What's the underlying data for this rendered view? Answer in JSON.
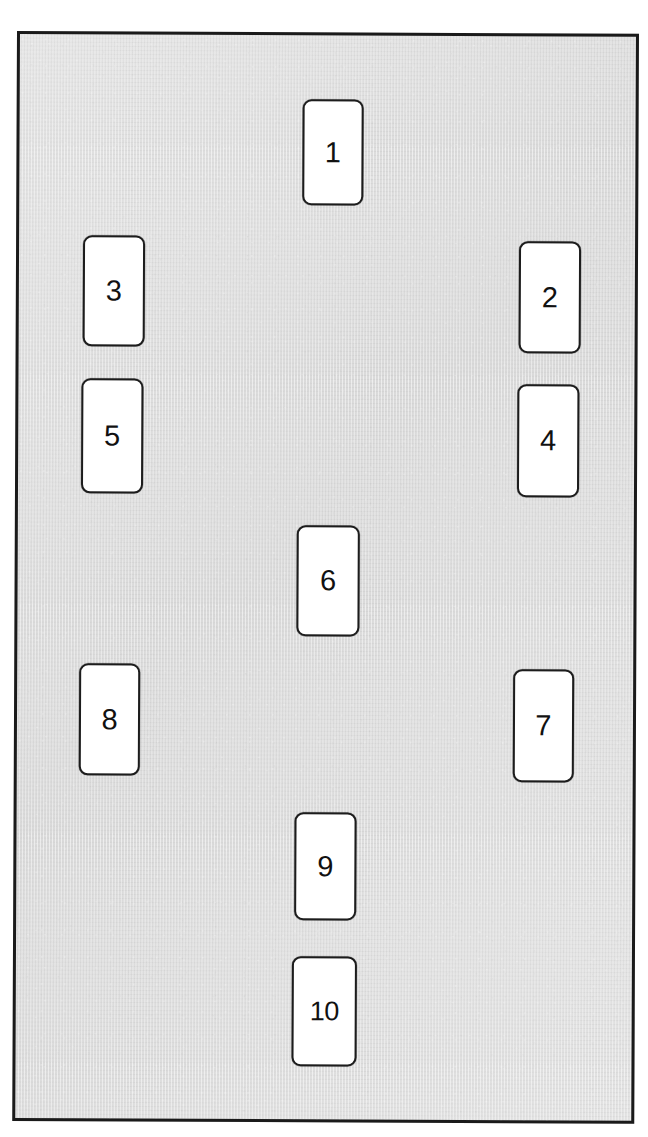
{
  "diagram": {
    "frame": {
      "border_color": "#1a1a1a",
      "fill_color": "#dedede"
    },
    "node_style": {
      "fill_color": "#ffffff",
      "border_color": "#1c1c1c",
      "text_color": "#111111"
    },
    "nodes": [
      {
        "id": "node-1",
        "label": "1",
        "column": "center",
        "x": 300,
        "y": 95,
        "w": 61,
        "h": 106
      },
      {
        "id": "node-2",
        "label": "2",
        "column": "right",
        "x": 517,
        "y": 236,
        "w": 62,
        "h": 112
      },
      {
        "id": "node-3",
        "label": "3",
        "column": "left",
        "x": 81,
        "y": 232,
        "w": 62,
        "h": 111
      },
      {
        "id": "node-4",
        "label": "4",
        "column": "right",
        "x": 516,
        "y": 379,
        "w": 62,
        "h": 113
      },
      {
        "id": "node-5",
        "label": "5",
        "column": "left",
        "x": 80,
        "y": 375,
        "w": 62,
        "h": 115
      },
      {
        "id": "node-6",
        "label": "6",
        "column": "center",
        "x": 296,
        "y": 521,
        "w": 63,
        "h": 111
      },
      {
        "id": "node-7",
        "label": "7",
        "column": "right",
        "x": 513,
        "y": 664,
        "w": 61,
        "h": 113
      },
      {
        "id": "node-8",
        "label": "8",
        "column": "left",
        "x": 79,
        "y": 660,
        "w": 61,
        "h": 112
      },
      {
        "id": "node-9",
        "label": "9",
        "column": "center",
        "x": 295,
        "y": 808,
        "w": 62,
        "h": 108
      },
      {
        "id": "node-10",
        "label": "10",
        "column": "center",
        "x": 293,
        "y": 952,
        "w": 65,
        "h": 110
      }
    ]
  }
}
